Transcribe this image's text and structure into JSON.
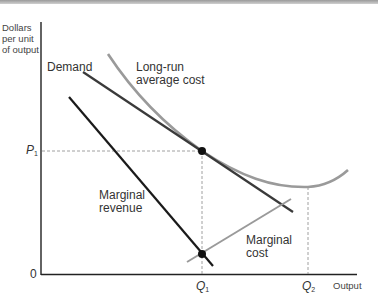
{
  "diagram": {
    "y_axis_label_lines": [
      "Dollars",
      "per unit",
      "of output"
    ],
    "x_axis_label": "Output",
    "origin_label": "0",
    "price_label": {
      "letter": "P",
      "sub": "1"
    },
    "q1_label": {
      "letter": "Q",
      "sub": "1"
    },
    "q2_label": {
      "letter": "Q",
      "sub": "2"
    },
    "curves": {
      "demand": {
        "label": "Demand",
        "color": "#3a3a3a"
      },
      "lrac": {
        "label_lines": [
          "Long-run",
          "average cost"
        ],
        "color": "#9a9a9a"
      },
      "marginal_revenue": {
        "label_lines": [
          "Marginal",
          "revenue"
        ],
        "color": "#1a1a1a"
      },
      "marginal_cost": {
        "label_lines": [
          "Marginal",
          "cost"
        ],
        "color": "#9a9a9a"
      }
    },
    "points": [
      {
        "name": "demand-lrac-intersection",
        "at": "Q1, P1"
      },
      {
        "name": "mr-mc-intersection",
        "at": "Q1"
      }
    ]
  }
}
